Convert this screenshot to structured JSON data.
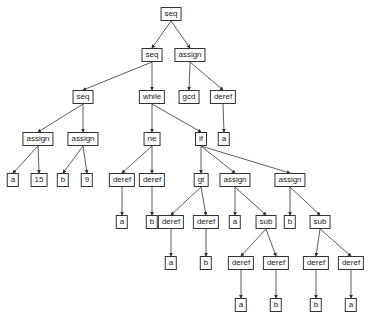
{
  "nodes": [
    {
      "id": "n0",
      "label": "seq",
      "x": 171,
      "y": 14
    },
    {
      "id": "n1",
      "label": "seq",
      "x": 152,
      "y": 55
    },
    {
      "id": "n2",
      "label": "assign",
      "x": 190,
      "y": 55
    },
    {
      "id": "n3",
      "label": "seq",
      "x": 83,
      "y": 97
    },
    {
      "id": "n4",
      "label": "while",
      "x": 152,
      "y": 97
    },
    {
      "id": "n5",
      "label": "gcd",
      "x": 189,
      "y": 97
    },
    {
      "id": "n6",
      "label": "deref",
      "x": 223,
      "y": 97
    },
    {
      "id": "n7",
      "label": "assign",
      "x": 38,
      "y": 139
    },
    {
      "id": "n8",
      "label": "assign",
      "x": 83,
      "y": 139
    },
    {
      "id": "n9",
      "label": "ne",
      "x": 152,
      "y": 139
    },
    {
      "id": "n10",
      "label": "if",
      "x": 201,
      "y": 139
    },
    {
      "id": "n11",
      "label": "a",
      "x": 224,
      "y": 139
    },
    {
      "id": "n12",
      "label": "a",
      "x": 13,
      "y": 180
    },
    {
      "id": "n13",
      "label": "15",
      "x": 39,
      "y": 180
    },
    {
      "id": "n14",
      "label": "b",
      "x": 63,
      "y": 180
    },
    {
      "id": "n15",
      "label": "9",
      "x": 87,
      "y": 180
    },
    {
      "id": "n16",
      "label": "deref",
      "x": 122,
      "y": 180
    },
    {
      "id": "n17",
      "label": "deref",
      "x": 152,
      "y": 180
    },
    {
      "id": "n18",
      "label": "gt",
      "x": 201,
      "y": 180
    },
    {
      "id": "n19",
      "label": "assign",
      "x": 235,
      "y": 180
    },
    {
      "id": "n20",
      "label": "assign",
      "x": 290,
      "y": 180
    },
    {
      "id": "n21",
      "label": "a",
      "x": 122,
      "y": 222
    },
    {
      "id": "n22",
      "label": "b",
      "x": 152,
      "y": 222
    },
    {
      "id": "n23",
      "label": "deref",
      "x": 171,
      "y": 222
    },
    {
      "id": "n24",
      "label": "deref",
      "x": 206,
      "y": 222
    },
    {
      "id": "n25",
      "label": "a",
      "x": 235,
      "y": 222
    },
    {
      "id": "n26",
      "label": "sub",
      "x": 266,
      "y": 222
    },
    {
      "id": "n27",
      "label": "b",
      "x": 290,
      "y": 222
    },
    {
      "id": "n28",
      "label": "sub",
      "x": 320,
      "y": 222
    },
    {
      "id": "n29",
      "label": "a",
      "x": 171,
      "y": 263
    },
    {
      "id": "n30",
      "label": "b",
      "x": 206,
      "y": 263
    },
    {
      "id": "n31",
      "label": "deref",
      "x": 241,
      "y": 263
    },
    {
      "id": "n32",
      "label": "deref",
      "x": 276,
      "y": 263
    },
    {
      "id": "n33",
      "label": "deref",
      "x": 316,
      "y": 263
    },
    {
      "id": "n34",
      "label": "deref",
      "x": 351,
      "y": 263
    },
    {
      "id": "n35",
      "label": "a",
      "x": 241,
      "y": 305
    },
    {
      "id": "n36",
      "label": "b",
      "x": 276,
      "y": 305
    },
    {
      "id": "n37",
      "label": "b",
      "x": 316,
      "y": 305
    },
    {
      "id": "n38",
      "label": "a",
      "x": 351,
      "y": 305
    }
  ],
  "edges": [
    [
      "n0",
      "n1"
    ],
    [
      "n0",
      "n2"
    ],
    [
      "n1",
      "n3"
    ],
    [
      "n1",
      "n4"
    ],
    [
      "n2",
      "n5"
    ],
    [
      "n2",
      "n6"
    ],
    [
      "n3",
      "n7"
    ],
    [
      "n3",
      "n8"
    ],
    [
      "n4",
      "n9"
    ],
    [
      "n4",
      "n10"
    ],
    [
      "n6",
      "n11"
    ],
    [
      "n7",
      "n12"
    ],
    [
      "n7",
      "n13"
    ],
    [
      "n8",
      "n14"
    ],
    [
      "n8",
      "n15"
    ],
    [
      "n9",
      "n16"
    ],
    [
      "n9",
      "n17"
    ],
    [
      "n10",
      "n18"
    ],
    [
      "n10",
      "n19"
    ],
    [
      "n10",
      "n20"
    ],
    [
      "n16",
      "n21"
    ],
    [
      "n17",
      "n22"
    ],
    [
      "n18",
      "n23"
    ],
    [
      "n18",
      "n24"
    ],
    [
      "n19",
      "n25"
    ],
    [
      "n19",
      "n26"
    ],
    [
      "n20",
      "n27"
    ],
    [
      "n20",
      "n28"
    ],
    [
      "n23",
      "n29"
    ],
    [
      "n24",
      "n30"
    ],
    [
      "n26",
      "n31"
    ],
    [
      "n26",
      "n32"
    ],
    [
      "n28",
      "n33"
    ],
    [
      "n28",
      "n34"
    ],
    [
      "n31",
      "n35"
    ],
    [
      "n32",
      "n36"
    ],
    [
      "n33",
      "n37"
    ],
    [
      "n34",
      "n38"
    ]
  ],
  "style": {
    "edge_color": "#333333",
    "node_border": "#333333"
  }
}
